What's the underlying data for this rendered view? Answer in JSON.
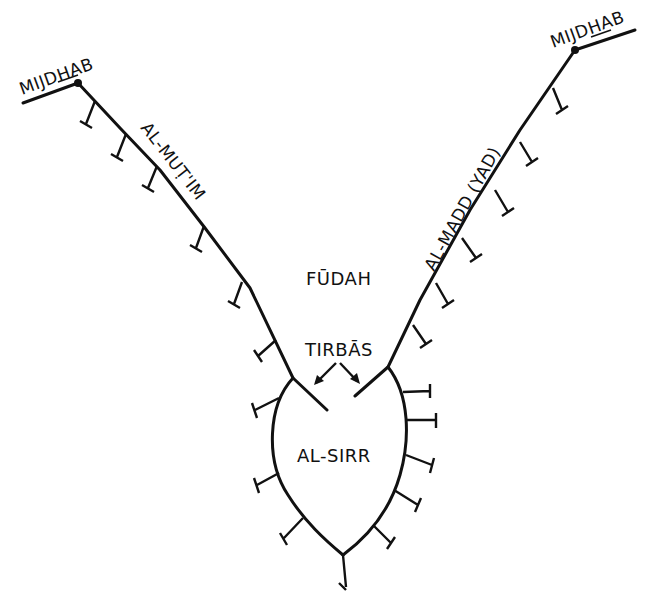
{
  "diagram": {
    "type": "schematic line drawing",
    "colors": {
      "ink": "#111111",
      "background": "#ffffff"
    },
    "labels": {
      "mijdhab_left": "MIJDHAB",
      "mijdhab_right": "MIJDHAB",
      "al_mutim": "AL-MUṬ'IM",
      "al_madd": "AL-MADD (YAD)",
      "fudah": "FŪDAH",
      "tirbas": "TIRBĀS",
      "al_sirr": "AL-SIRR"
    }
  }
}
